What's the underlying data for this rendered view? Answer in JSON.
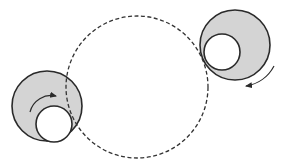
{
  "diagram": {
    "colors": {
      "background": "#ffffff",
      "stroke": "#2a2a2a",
      "fill_shaded": "#d4d4d4",
      "inner_fill": "#ffffff",
      "dashed_path": "#333333"
    },
    "path_circle": {
      "cx": 137,
      "cy": 87,
      "r": 71,
      "style": "dashed"
    },
    "rollers": [
      {
        "id": "left",
        "outer": {
          "cx": 47,
          "cy": 106,
          "r": 35
        },
        "inner": {
          "cx": 54,
          "cy": 124,
          "r": 18
        },
        "arrow": {
          "direction": "clockwise",
          "path": "M30 112 A22 22 0 0 1 56 96"
        }
      },
      {
        "id": "right",
        "outer": {
          "cx": 235,
          "cy": 45,
          "r": 35
        },
        "inner": {
          "cx": 222,
          "cy": 52,
          "r": 18
        },
        "arrow": {
          "direction": "clockwise",
          "path": "M274 66 A38 38 0 0 1 246 86"
        }
      }
    ]
  }
}
